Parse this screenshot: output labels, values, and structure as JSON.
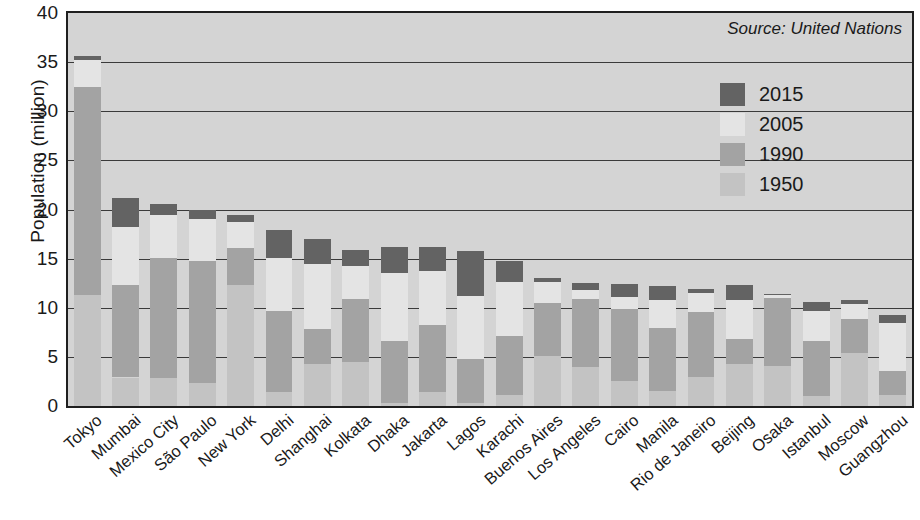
{
  "chart_data": {
    "type": "bar",
    "subtype": "stacked-range-bar",
    "title": "",
    "xlabel": "",
    "ylabel": "Population (million)",
    "ylim": [
      0,
      40
    ],
    "yticks": [
      0,
      5,
      10,
      15,
      20,
      25,
      30,
      35,
      40
    ],
    "grid": true,
    "legend_position": "top-right-inside",
    "annotation": "Source: United Nations",
    "legend": [
      {
        "name": "2015",
        "color": "#636363"
      },
      {
        "name": "2005",
        "color": "#e4e4e4"
      },
      {
        "name": "1990",
        "color": "#a3a3a3"
      },
      {
        "name": "1950",
        "color": "#c3c3c3"
      }
    ],
    "categories": [
      "Tokyo",
      "Mumbai",
      "Mexico City",
      "São Paulo",
      "New York",
      "Delhi",
      "Shanghai",
      "Kolkata",
      "Dhaka",
      "Jakarta",
      "Lagos",
      "Karachi",
      "Buenos Aires",
      "Los Angeles",
      "Cairo",
      "Manila",
      "Rio de Janeiro",
      "Beijing",
      "Osaka",
      "Istanbul",
      "Moscow",
      "Guangzhou"
    ],
    "series": [
      {
        "name": "1950",
        "values": [
          11.3,
          2.9,
          2.9,
          2.3,
          12.3,
          1.4,
          4.3,
          4.5,
          0.3,
          1.4,
          0.3,
          1.1,
          5.1,
          4.0,
          2.5,
          1.5,
          3.0,
          4.3,
          4.1,
          1.0,
          5.4,
          1.1
        ]
      },
      {
        "name": "1990",
        "values": [
          32.5,
          12.3,
          15.1,
          14.8,
          16.1,
          9.7,
          7.8,
          10.9,
          6.6,
          8.2,
          4.8,
          7.1,
          10.5,
          10.9,
          9.9,
          7.9,
          9.6,
          6.8,
          11.0,
          6.6,
          8.9,
          3.6
        ]
      },
      {
        "name": "2005",
        "values": [
          35.2,
          18.2,
          19.4,
          19.0,
          18.7,
          15.1,
          14.5,
          14.3,
          13.5,
          13.7,
          11.2,
          12.6,
          12.6,
          11.8,
          11.1,
          10.8,
          11.5,
          10.8,
          11.3,
          9.7,
          10.4,
          8.4
        ]
      },
      {
        "name": "2015",
        "values": [
          35.6,
          21.2,
          20.6,
          20.0,
          19.4,
          17.9,
          17.0,
          15.9,
          16.2,
          16.2,
          15.8,
          14.8,
          13.0,
          12.5,
          12.4,
          12.2,
          11.9,
          12.3,
          11.4,
          10.6,
          10.8,
          9.3
        ]
      }
    ]
  }
}
